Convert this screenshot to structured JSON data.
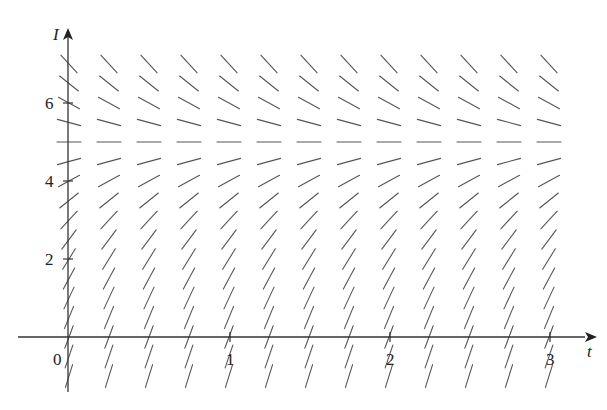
{
  "chart_data": {
    "type": "slope_field",
    "title": "",
    "xlabel": "t",
    "ylabel": "I",
    "equation_hint": "dI/dt proportional to (5 - I); equilibrium at I = 5",
    "equilibrium": 5,
    "x_ticks": [
      {
        "value": 0,
        "label": "0"
      },
      {
        "value": 1,
        "label": "1"
      },
      {
        "value": 2,
        "label": "2"
      },
      {
        "value": 3,
        "label": "3"
      }
    ],
    "y_ticks": [
      {
        "value": 2,
        "label": "2"
      },
      {
        "value": 4,
        "label": "4"
      },
      {
        "value": 6,
        "label": "6"
      }
    ],
    "xlim": [
      -0.3,
      3.3
    ],
    "ylim": [
      -1.3,
      7.5
    ],
    "grid": {
      "t_start": 0,
      "t_end": 3,
      "t_step": 0.25,
      "I_start": -1,
      "I_end": 7,
      "I_step": 0.5
    },
    "slope_coefficient": 2.2,
    "segment_length_px": 24,
    "grid_lines": false,
    "legend": null
  },
  "layout": {
    "origin_px": [
      70,
      337
    ],
    "px_per_t": 160,
    "px_per_I": 39,
    "x_axis_px": [
      18,
      585
    ],
    "y_axis_top_px": 28,
    "y_axis_bottom_px": 392,
    "colors": {
      "axis": "#333333",
      "segments": "#555555",
      "background": "#ffffff"
    }
  }
}
